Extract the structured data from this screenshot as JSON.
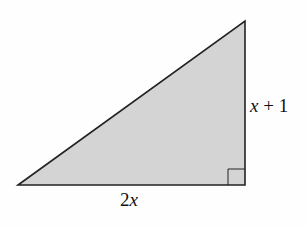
{
  "diagram": {
    "shape": "right-triangle",
    "fill_color": "#d4d4d4",
    "stroke_color": "#222222",
    "vertices": {
      "bottom_left": [
        18,
        185
      ],
      "top_right": [
        245,
        21
      ],
      "bottom_right": [
        245,
        185
      ]
    },
    "right_angle_marker": "bottom-right",
    "labels": {
      "base": {
        "coef": "2",
        "var": "x"
      },
      "height": {
        "var": "x",
        "rest": " + 1"
      }
    }
  }
}
